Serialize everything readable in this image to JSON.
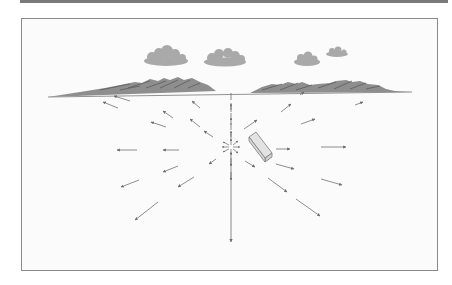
{
  "figure": {
    "colors": {
      "top_bar": "#7a7a7a",
      "frame_border": "#8a8a8a",
      "background": "#fbfbfb",
      "cloud": "#a8a8a8",
      "mountain": "#8c8c8c",
      "mountain_dark": "#5e5e5e",
      "arrow": "#707070",
      "block_fill": "#e4e4e4",
      "block_stroke": "#808080"
    },
    "source_point": {
      "x": 230,
      "y": 147
    },
    "horizon_y": 92,
    "clouds": [
      {
        "cx": 166,
        "cy": 58,
        "w": 44,
        "h": 16
      },
      {
        "cx": 225,
        "cy": 59,
        "w": 42,
        "h": 15
      },
      {
        "cx": 307,
        "cy": 59,
        "w": 26,
        "h": 12
      },
      {
        "cx": 337,
        "cy": 52,
        "w": 22,
        "h": 8
      }
    ],
    "arrows": [
      {
        "x1": 118,
        "y1": 108,
        "x2": 103,
        "y2": 102
      },
      {
        "x1": 166,
        "y1": 127,
        "x2": 151,
        "y2": 122
      },
      {
        "x1": 137,
        "y1": 150,
        "x2": 117,
        "y2": 150
      },
      {
        "x1": 179,
        "y1": 150,
        "x2": 163,
        "y2": 150
      },
      {
        "x1": 139,
        "y1": 180,
        "x2": 121,
        "y2": 187
      },
      {
        "x1": 178,
        "y1": 166,
        "x2": 163,
        "y2": 172
      },
      {
        "x1": 194,
        "y1": 177,
        "x2": 178,
        "y2": 187
      },
      {
        "x1": 216,
        "y1": 159,
        "x2": 209,
        "y2": 164
      },
      {
        "x1": 158,
        "y1": 202,
        "x2": 135,
        "y2": 220
      },
      {
        "x1": 160,
        "y1": 108,
        "x2": 173,
        "y2": 118
      },
      {
        "x1": 190,
        "y1": 96,
        "x2": 175,
        "y2": 106
      },
      {
        "x1": 200,
        "y1": 118,
        "x2": 190,
        "y2": 112
      },
      {
        "x1": 213,
        "y1": 134,
        "x2": 200,
        "y2": 125
      },
      {
        "x1": 244,
        "y1": 129,
        "x2": 257,
        "y2": 120
      },
      {
        "x1": 281,
        "y1": 112,
        "x2": 291,
        "y2": 104
      },
      {
        "x1": 300,
        "y1": 94,
        "x2": 304,
        "y2": 91
      },
      {
        "x1": 301,
        "y1": 124,
        "x2": 315,
        "y2": 119
      },
      {
        "x1": 355,
        "y1": 105,
        "x2": 362,
        "y2": 102
      },
      {
        "x1": 278,
        "y1": 149,
        "x2": 290,
        "y2": 149
      },
      {
        "x1": 321,
        "y1": 147,
        "x2": 346,
        "y2": 147
      },
      {
        "x1": 245,
        "y1": 161,
        "x2": 255,
        "y2": 167
      },
      {
        "x1": 276,
        "y1": 164,
        "x2": 294,
        "y2": 169
      },
      {
        "x1": 321,
        "y1": 179,
        "x2": 342,
        "y2": 185
      },
      {
        "x1": 268,
        "y1": 178,
        "x2": 287,
        "y2": 192
      },
      {
        "x1": 296,
        "y1": 199,
        "x2": 320,
        "y2": 216
      }
    ],
    "vertical_line": {
      "x": 231,
      "y_top": 92,
      "y_bottom": 242
    },
    "block": {
      "points": "249,136 258,131 271,153 262,158",
      "label": ""
    }
  }
}
